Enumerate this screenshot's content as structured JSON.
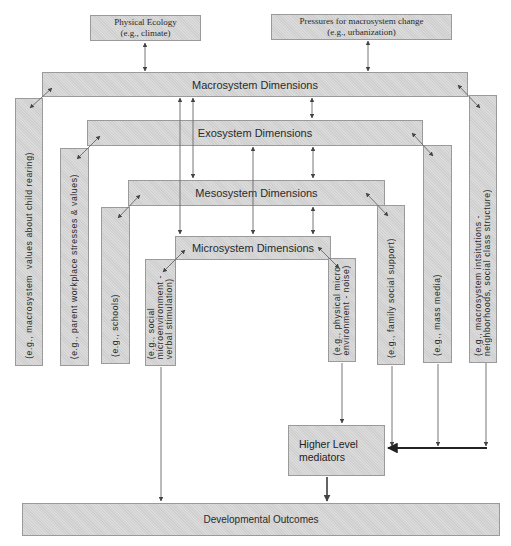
{
  "diagram": {
    "top_inputs": {
      "physical_ecology": {
        "line1": "Physical Ecology",
        "line2": "(e.g., climate)"
      },
      "pressures": {
        "line1": "Pressures for macrosystem  change",
        "line2": "(e.g., urbanization)"
      }
    },
    "levels": {
      "macro": {
        "label": "Macrosystem Dimensions",
        "left_example": "(e.g., macrosystem  values about child rearing)",
        "right_example": "(e.g., macrosystem intsitutions -\nneighborhoods, social class structure)"
      },
      "exo": {
        "label": "Exosystem Dimensions",
        "left_example": "(e.g., parent workplace stresses & values)",
        "right_example": "(e.g., mass media)"
      },
      "meso": {
        "label": "Mesosystem Dimensions",
        "left_example": "(e.g., schools)",
        "right_example": "(e.g., family social support)"
      },
      "micro": {
        "label": "Microsystem Dimensions",
        "left_example": "(e.g., social\nmicroenvironment -\nverbal stimulation)",
        "right_example": "(e.g., physical micro-\nenvironment - noise)"
      }
    },
    "mediators": {
      "line1": "Higher Level",
      "line2": "mediators"
    },
    "outcome": {
      "label": "Developmental Outcomes"
    }
  },
  "colors": {
    "box_fill": "#cfcfcf",
    "box_border": "#9a9a9a",
    "arrow": "#555555",
    "thick_arrow": "#222222"
  }
}
